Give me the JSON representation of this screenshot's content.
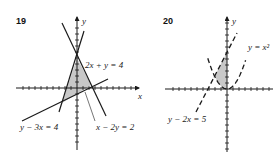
{
  "problems": [
    {
      "number": "19",
      "axis_labels": {
        "x": "x",
        "y": "y"
      },
      "equations": [
        "2x + y = 4",
        "x − 2y = 2",
        "y − 3x = 4"
      ],
      "line_style": "solid",
      "shaded_region": "triangle bounded by 2x + y = 4, x − 2y = 2, y − 3x = 4"
    },
    {
      "number": "20",
      "axis_labels": {
        "x": "x",
        "y": "y"
      },
      "equations": [
        "y = x²",
        "y − 2x = 5"
      ],
      "line_style": "dashed",
      "shaded_region": "region between y = x² and y − 2x = 5 with x ≤ 0"
    }
  ],
  "colors": {
    "ink": "#1a1a1a",
    "shade": "#c8c8c8"
  }
}
